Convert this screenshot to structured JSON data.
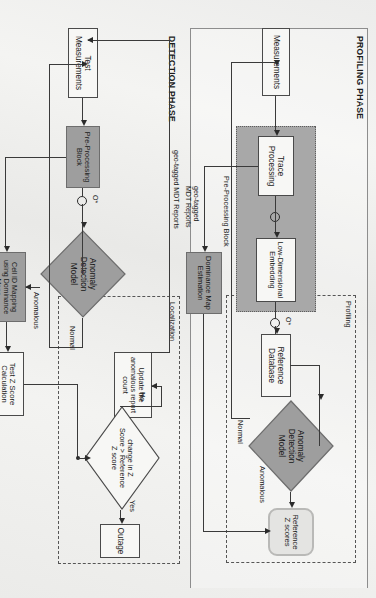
{
  "figure": {
    "type": "flowchart",
    "orientation": "rotated-90",
    "phases": [
      {
        "id": "profiling",
        "label": "PROFILING PHASE"
      },
      {
        "id": "detection",
        "label": "DETECTION PHASE"
      }
    ],
    "groups": [
      {
        "id": "profiling-group",
        "label": "Profiling"
      },
      {
        "id": "localization-group",
        "label": "Localization"
      },
      {
        "id": "preprocessing-block",
        "label": "Pre-Processing Block"
      }
    ]
  },
  "profiling": {
    "measurements": "Measurements",
    "trace_processing": "Trace\nProcessing",
    "low_dim_embedding": "Low-Dimensional\nEmbedding",
    "dominance_map_estimation": "Dominance Map\nEstimation",
    "reference_database": "Reference\nDatabase",
    "anomaly_detection_model": "Anomaly\nDetection\nModel",
    "reference_z_scores": "Reference\nZ scores",
    "edge_normal": "Normal",
    "edge_anomalous": "Anomalous",
    "edge_geo_tagged": "geo-tagged\nMDT Reports",
    "junction_1": "O",
    "junction_2": "O*"
  },
  "detection": {
    "test_measurements": "Test\nMeasurements",
    "preprocessing_block": "Pre-Processing\nBlock",
    "anomaly_detection_model": "Anomaly\nDetection\nModel",
    "cell_id_mapping": "Cell ID Mapping\nusing Dominance\nMaps",
    "update_report_count": "Update the\nanomalous report\ncount",
    "test_z_score_calculation": "Test Z Score\nCalculation",
    "decision": "change in Z\nScore > Reference\nZ score",
    "outage": "Outage",
    "edge_normal": "Normal",
    "edge_anomalous": "Anomalous",
    "edge_geo_tagged": "geo-tagged MDT Reports",
    "edge_no": "No",
    "edge_yes": "Yes",
    "junction_1": "O*"
  },
  "colors": {
    "page_bg": "#f2f2f0",
    "node_fill": "#f7f7f5",
    "gray_fill": "#9e9e9e",
    "block_fill": "#a8a8a8",
    "rounded_fill": "#e4e4e2",
    "stroke": "#4a4a4a",
    "arrow": "#2b2b2b"
  }
}
